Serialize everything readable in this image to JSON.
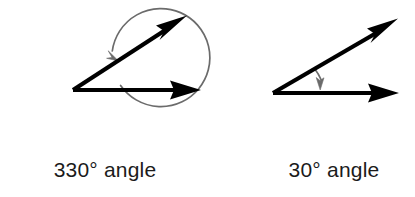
{
  "page": {
    "background_color": "#ffffff"
  },
  "figures": [
    {
      "id": "reflex-angle-figure",
      "caption": "330° angle",
      "angle_value": 330,
      "angle_unit": "degrees",
      "angle_type": "reflex",
      "vertex": {
        "x": 73,
        "y": 90
      },
      "rays": [
        {
          "name": "horizontal-ray",
          "from": {
            "x": 73,
            "y": 90
          },
          "to": {
            "x": 200,
            "y": 90
          },
          "color": "#000000",
          "has_arrowhead": true
        },
        {
          "name": "upper-ray",
          "from": {
            "x": 73,
            "y": 90
          },
          "to": {
            "x": 186,
            "y": 17
          },
          "color": "#000000",
          "has_arrowhead": true,
          "elevation_degrees": 33
        }
      ],
      "arc": {
        "name": "reflex-sweep-arc",
        "center": {
          "x": 73,
          "y": 79
        },
        "radius": 49,
        "color": "#6b6b6b",
        "direction": "counterclockwise",
        "sweep_degrees": 330,
        "has_arrowhead": true
      }
    },
    {
      "id": "acute-angle-figure",
      "caption": "30° angle",
      "angle_value": 30,
      "angle_unit": "degrees",
      "angle_type": "acute",
      "vertex": {
        "x": 273,
        "y": 93
      },
      "rays": [
        {
          "name": "horizontal-ray",
          "from": {
            "x": 273,
            "y": 93
          },
          "to": {
            "x": 398,
            "y": 93
          },
          "color": "#000000",
          "has_arrowhead": true
        },
        {
          "name": "upper-ray",
          "from": {
            "x": 273,
            "y": 93
          },
          "to": {
            "x": 397,
            "y": 20
          },
          "color": "#000000",
          "has_arrowhead": true,
          "elevation_degrees": 30
        }
      ],
      "arc": {
        "name": "acute-sweep-arc",
        "center": {
          "x": 273,
          "y": 93
        },
        "radius": 48,
        "color": "#6b6b6b",
        "direction": "clockwise",
        "sweep_degrees": 30,
        "has_arrowhead": true
      }
    }
  ],
  "colors": {
    "stroke_dark": "#000000",
    "stroke_arc": "#6b6b6b",
    "text": "#1b1b1b",
    "background": "#ffffff"
  }
}
